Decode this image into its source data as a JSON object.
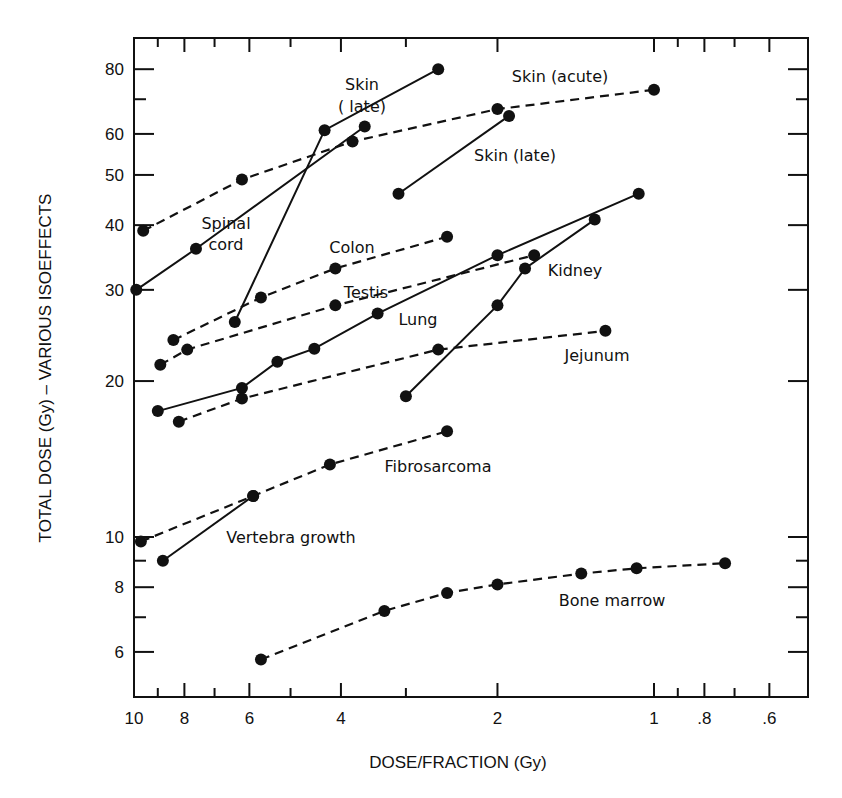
{
  "chart_data": {
    "type": "line",
    "title": "",
    "xlabel": "DOSE/FRACTION (Gy)",
    "ylabel": "TOTAL DOSE (Gy)  –  VARIOUS ISOEFFECTS",
    "xscale": "log",
    "yscale": "log",
    "x_reversed": true,
    "xlim": [
      10,
      0.5
    ],
    "ylim": [
      5.1,
      95
    ],
    "grid": false,
    "legend": "inline labels",
    "x_tick_labels": [
      "10",
      "8",
      "6",
      "4",
      "2",
      "1",
      ".8",
      ".6"
    ],
    "x_tick_values": [
      10,
      8,
      6,
      4,
      2,
      1,
      0.8,
      0.6
    ],
    "x_minor_ticks": [
      9,
      7,
      5,
      3,
      0.9,
      0.7
    ],
    "y_tick_labels": [
      "80",
      "60",
      "50",
      "40",
      "30",
      "20",
      "10",
      "8",
      "6"
    ],
    "y_tick_values": [
      80,
      60,
      50,
      40,
      30,
      20,
      10,
      8,
      6
    ],
    "y_minor_ticks": [
      70,
      9,
      7
    ],
    "series": [
      {
        "name": "Skin (acute)",
        "style": "dashed",
        "x": [
          9.6,
          6.2,
          3.8,
          2.0,
          1.0
        ],
        "y": [
          39,
          49,
          58,
          67,
          73
        ]
      },
      {
        "name": "Skin (late)",
        "style": "solid",
        "x": [
          6.4,
          4.3,
          2.6
        ],
        "y": [
          26,
          61,
          80
        ]
      },
      {
        "name": "Skin (late) 2",
        "label": "Skin (late)",
        "style": "solid",
        "x": [
          3.1,
          1.9
        ],
        "y": [
          46,
          65
        ]
      },
      {
        "name": "Spinal cord",
        "style": "solid",
        "x": [
          9.9,
          7.6,
          3.6
        ],
        "y": [
          30,
          36,
          62
        ]
      },
      {
        "name": "Colon",
        "style": "dashed",
        "x": [
          8.4,
          5.7,
          4.1,
          2.5
        ],
        "y": [
          24,
          29,
          33,
          38
        ]
      },
      {
        "name": "Testis",
        "style": "dashed",
        "x": [
          8.9,
          7.9,
          4.1,
          1.7
        ],
        "y": [
          21.5,
          23,
          28,
          35
        ]
      },
      {
        "name": "Lung",
        "style": "solid",
        "x": [
          9.0,
          6.2,
          5.3,
          4.5,
          3.4,
          2.0,
          1.07
        ],
        "y": [
          17.5,
          19.4,
          21.8,
          23.1,
          27,
          35,
          46
        ]
      },
      {
        "name": "Kidney",
        "style": "solid",
        "x": [
          3.0,
          2.0,
          1.77,
          1.3
        ],
        "y": [
          18.7,
          28,
          33,
          41
        ]
      },
      {
        "name": "Jejunum",
        "style": "dashed",
        "x": [
          8.2,
          6.2,
          2.6,
          1.24
        ],
        "y": [
          16.7,
          18.5,
          23,
          25
        ]
      },
      {
        "name": "Fibrosarcoma",
        "style": "dashed",
        "x": [
          9.7,
          5.9,
          4.2,
          2.5
        ],
        "y": [
          9.8,
          12.0,
          13.8,
          16.0
        ]
      },
      {
        "name": "Vertebra growth",
        "style": "solid",
        "x": [
          8.8,
          5.9
        ],
        "y": [
          9.0,
          12.0
        ]
      },
      {
        "name": "Bone marrow",
        "style": "dashed",
        "x": [
          5.7,
          3.3,
          2.5,
          2.0,
          1.38,
          1.08,
          0.73
        ],
        "y": [
          5.8,
          7.2,
          7.8,
          8.1,
          8.5,
          8.7,
          8.9
        ]
      }
    ],
    "annotations": [
      {
        "text": "Skin",
        "x_px": 362,
        "y_px": 90
      },
      {
        "text": "( late)",
        "x_px": 362,
        "y_px": 112
      },
      {
        "text": "Skin (acute)",
        "x_px": 560,
        "y_px": 82
      },
      {
        "text": "Skin (late)",
        "x_px": 515,
        "y_px": 161
      },
      {
        "text": "Spinal",
        "x_px": 226,
        "y_px": 229
      },
      {
        "text": "cord",
        "x_px": 226,
        "y_px": 250
      },
      {
        "text": "Colon",
        "x_px": 352,
        "y_px": 253
      },
      {
        "text": "Testis",
        "x_px": 366,
        "y_px": 298
      },
      {
        "text": "Lung",
        "x_px": 418,
        "y_px": 325
      },
      {
        "text": "Kidney",
        "x_px": 575,
        "y_px": 276
      },
      {
        "text": "Jejunum",
        "x_px": 597,
        "y_px": 361
      },
      {
        "text": "Fibrosarcoma",
        "x_px": 438,
        "y_px": 472
      },
      {
        "text": "Vertebra growth",
        "x_px": 291,
        "y_px": 543
      },
      {
        "text": "Bone marrow",
        "x_px": 612,
        "y_px": 606
      }
    ]
  }
}
